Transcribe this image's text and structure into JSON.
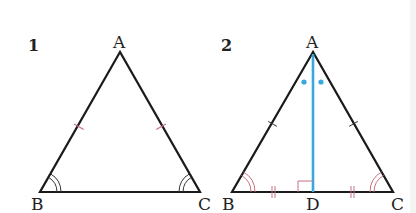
{
  "figures": [
    {
      "number": "1",
      "vertices": {
        "A": "A",
        "B": "B",
        "C": "C"
      },
      "description": "Isosceles triangle ABC with AB = AC and base angles B and C equal"
    },
    {
      "number": "2",
      "vertices": {
        "A": "A",
        "B": "B",
        "C": "C",
        "D": "D"
      },
      "description": "Isosceles triangle ABC with bisector AD of angle A, perpendicular to BC, BD = DC"
    }
  ],
  "colors": {
    "stroke": "#1a1a1a",
    "bisector": "#3aa8dc",
    "marks": "#c87080",
    "text": "#222222"
  }
}
